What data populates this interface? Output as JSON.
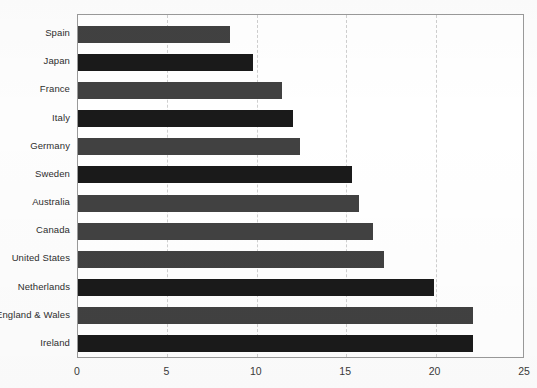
{
  "chart_data": {
    "type": "bar",
    "orientation": "horizontal",
    "title": "",
    "subtitle": "",
    "xlabel": "",
    "ylabel": "",
    "xlim": [
      0,
      25
    ],
    "ylim": null,
    "grid": true,
    "grid_axis": "x",
    "legend": false,
    "legend_position": "none",
    "xticks": [
      "0",
      "5",
      "10",
      "15",
      "20",
      "25"
    ],
    "xtick_values": [
      0,
      5,
      10,
      15,
      20,
      25
    ],
    "categories": [
      "Spain",
      "Japan",
      "France",
      "Italy",
      "Germany",
      "Sweden",
      "Australia",
      "Canada",
      "United States",
      "Netherlands",
      "England & Wales",
      "Ireland"
    ],
    "values": [
      8.5,
      9.8,
      11.4,
      12.0,
      12.4,
      15.3,
      15.7,
      16.5,
      17.1,
      19.9,
      22.1,
      22.1
    ],
    "bar_colors": [
      "#414141",
      "#1a1a1a",
      "#414141",
      "#1a1a1a",
      "#414141",
      "#1a1a1a",
      "#414141",
      "#414141",
      "#414141",
      "#1a1a1a",
      "#414141",
      "#1a1a1a"
    ]
  },
  "style": {
    "bar_gray": "#414141",
    "bar_black": "#1a1a1a",
    "axis_color": "#9a9a9a",
    "grid_color": "#cfcfcf",
    "text_color": "#2e2e2e",
    "background": "#ffffff"
  }
}
